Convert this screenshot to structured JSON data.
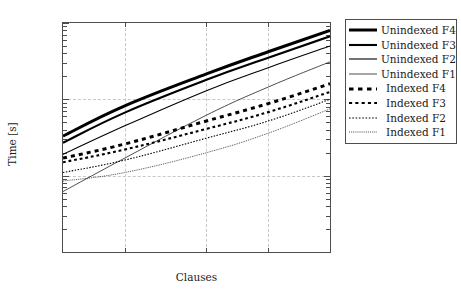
{
  "chart_data": {
    "type": "line",
    "title": "",
    "xlabel": "Clauses",
    "ylabel": "Time [s]",
    "xscale": "log",
    "yscale": "log",
    "xlim": [
      1000,
      20000
    ],
    "ylim": [
      1,
      1000
    ],
    "grid": true,
    "legend_position": "right-outside",
    "xticks": [
      "1,000",
      "2,000",
      "5,000",
      "10,000",
      "20,000"
    ],
    "xtick_values": [
      1000,
      2000,
      5000,
      10000,
      20000
    ],
    "yticks": [
      "1",
      "10",
      "100",
      "1,000"
    ],
    "ytick_values": [
      1,
      10,
      100,
      1000
    ],
    "x": [
      1000,
      2000,
      5000,
      10000,
      20000
    ],
    "series": [
      {
        "name": "Unindexed F4",
        "style": "solid",
        "width": 3.0,
        "color": "#000000",
        "values": [
          33,
          82,
          215,
          420,
          800
        ]
      },
      {
        "name": "Unindexed F3",
        "style": "solid",
        "width": 2.1,
        "color": "#000000",
        "values": [
          27,
          67,
          180,
          350,
          670
        ]
      },
      {
        "name": "Unindexed F2",
        "style": "solid",
        "width": 1.1,
        "color": "#000000",
        "values": [
          19,
          45,
          130,
          260,
          500
        ]
      },
      {
        "name": "Unindexed F1",
        "style": "solid",
        "width": 0.7,
        "color": "#000000",
        "values": [
          6.2,
          17,
          62,
          145,
          310
        ]
      },
      {
        "name": "Indexed F4",
        "style": "dashed",
        "width": 3.0,
        "color": "#000000",
        "values": [
          17,
          26,
          52,
          88,
          160
        ]
      },
      {
        "name": "Indexed F3",
        "style": "dashed",
        "width": 2.1,
        "color": "#000000",
        "values": [
          15,
          22,
          41,
          68,
          125
        ]
      },
      {
        "name": "Indexed F2",
        "style": "dashed",
        "width": 1.1,
        "color": "#000000",
        "values": [
          11,
          16,
          31,
          52,
          100
        ]
      },
      {
        "name": "Indexed F1",
        "style": "dashed",
        "width": 0.7,
        "color": "#000000",
        "values": [
          8.5,
          11,
          20,
          36,
          75
        ]
      }
    ]
  },
  "legend": {
    "items": [
      {
        "label": "Unindexed F4"
      },
      {
        "label": "Unindexed F3"
      },
      {
        "label": "Unindexed F2"
      },
      {
        "label": "Unindexed F1"
      },
      {
        "label": "Indexed F4"
      },
      {
        "label": "Indexed F3"
      },
      {
        "label": "Indexed F2"
      },
      {
        "label": "Indexed F1"
      }
    ]
  },
  "colors": {
    "line": "#000000",
    "grid": "#c8c8c8",
    "frame": "#4d4d4d",
    "text": "#1a1a1a"
  }
}
